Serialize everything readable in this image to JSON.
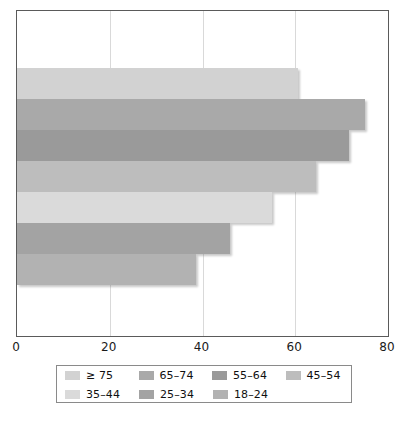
{
  "chart_data": {
    "type": "bar",
    "orientation": "horizontal",
    "title": "",
    "subtitle": "",
    "xlabel": "",
    "ylabel": "",
    "xlim": [
      0,
      80
    ],
    "ylim": [
      0,
      7
    ],
    "grid": true,
    "gridlines_x": [
      20,
      40,
      60
    ],
    "legend_position": "bottom",
    "xticks": [
      "0",
      "20",
      "40",
      "60",
      "80"
    ],
    "xtick_values": [
      0,
      20,
      40,
      60,
      80
    ],
    "categories": [
      "≥ 75",
      "65–74",
      "55–64",
      "45–54",
      "35–44",
      "25–34",
      "18–24"
    ],
    "values": [
      60.5,
      75.0,
      71.5,
      64.5,
      55.0,
      46.0,
      38.5
    ],
    "bar_colors": [
      "#d2d2d2",
      "#a9a9a9",
      "#9a9a9a",
      "#bdbdbd",
      "#dadada",
      "#a3a3a3",
      "#b2b2b2"
    ],
    "series": [
      {
        "name": "",
        "points": [
          {
            "category": "≥ 75",
            "value": 60.5,
            "color": "#d2d2d2"
          },
          {
            "category": "65–74",
            "value": 75.0,
            "color": "#a9a9a9"
          },
          {
            "category": "55–64",
            "value": 71.5,
            "color": "#9a9a9a"
          },
          {
            "category": "45–54",
            "value": 64.5,
            "color": "#bdbdbd"
          },
          {
            "category": "35–44",
            "value": 55.0,
            "color": "#dadada"
          },
          {
            "category": "25–34",
            "value": 46.0,
            "color": "#a3a3a3"
          },
          {
            "category": "18–24",
            "value": 38.5,
            "color": "#b2b2b2"
          }
        ]
      }
    ]
  },
  "legend": {
    "rows": [
      [
        {
          "label": "≥ 75",
          "color": "#d2d2d2"
        },
        {
          "label": "65–74",
          "color": "#a9a9a9"
        },
        {
          "label": "55–64",
          "color": "#9a9a9a"
        },
        {
          "label": "45–54",
          "color": "#bdbdbd"
        }
      ],
      [
        {
          "label": "35–44",
          "color": "#dadada"
        },
        {
          "label": "25–34",
          "color": "#a3a3a3"
        },
        {
          "label": "18–24",
          "color": "#b2b2b2"
        }
      ]
    ]
  },
  "axis": {
    "x_ticks": [
      {
        "label": "0",
        "value": 0
      },
      {
        "label": "20",
        "value": 20
      },
      {
        "label": "40",
        "value": 40
      },
      {
        "label": "60",
        "value": 60
      },
      {
        "label": "80",
        "value": 80
      }
    ]
  },
  "style": {
    "frame_color": "#5a5a5a",
    "grid_color": "#d9d9d9",
    "text_color": "#1a1a1a",
    "background": "#ffffff"
  }
}
